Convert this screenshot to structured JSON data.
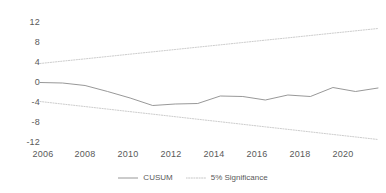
{
  "chart_data": {
    "type": "line",
    "title": "",
    "xlabel": "",
    "ylabel": "",
    "xlim": [
      2006,
      2021
    ],
    "ylim": [
      -12,
      12
    ],
    "grid": false,
    "legend_position": "bottom",
    "x": [
      2006,
      2007,
      2008,
      2009,
      2010,
      2011,
      2012,
      2013,
      2014,
      2015,
      2016,
      2017,
      2018,
      2019,
      2020,
      2021
    ],
    "yticks": [
      12,
      8,
      4,
      0,
      -4,
      -8,
      -12
    ],
    "ytick_labels": [
      "12",
      "8",
      "4",
      "0",
      "-4",
      "-8",
      "-12"
    ],
    "xticks": [
      2006,
      2008,
      2010,
      2012,
      2014,
      2016,
      2018,
      2020
    ],
    "xtick_labels": [
      "2006",
      "2008",
      "2010",
      "2012",
      "2014",
      "2016",
      "2018",
      "2020"
    ],
    "series": [
      {
        "name": "CUSUM",
        "style": "solid",
        "color": "#8c8c8c",
        "values": [
          -0.1,
          -0.2,
          -0.7,
          -1.9,
          -3.2,
          -4.7,
          -4.4,
          -4.3,
          -2.8,
          -2.9,
          -3.6,
          -2.6,
          -2.9,
          -1.1,
          -1.9,
          -1.2
        ]
      },
      {
        "name": "5% Significance",
        "style": "dotted",
        "color": "#bfbfbf",
        "upper": [
          3.7,
          4.17,
          4.63,
          5.1,
          5.57,
          6.03,
          6.5,
          6.97,
          7.43,
          7.9,
          8.37,
          8.83,
          9.3,
          9.77,
          10.23,
          10.7
        ],
        "lower": [
          -3.9,
          -4.41,
          -4.91,
          -5.42,
          -5.93,
          -6.43,
          -6.94,
          -7.45,
          -7.95,
          -8.46,
          -8.97,
          -9.47,
          -9.98,
          -10.49,
          -10.99,
          -11.5
        ]
      }
    ]
  },
  "legend": {
    "items": [
      {
        "label": "CUSUM"
      },
      {
        "label": "5% Significance"
      }
    ]
  }
}
